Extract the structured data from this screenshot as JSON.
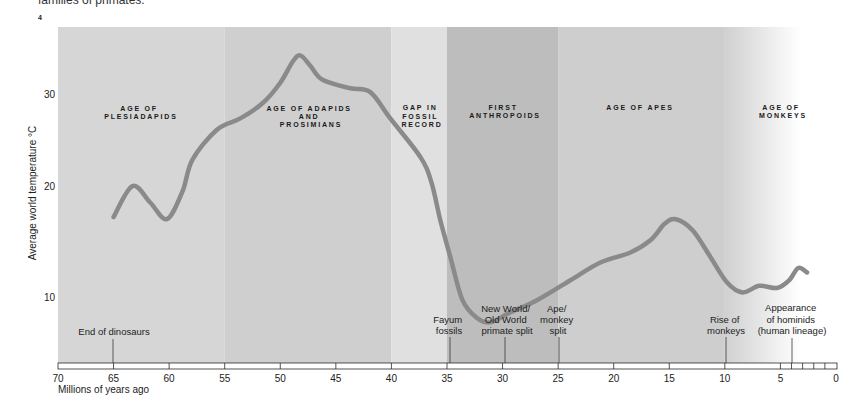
{
  "page": {
    "caption_fragment": "families of primates.",
    "figure_number": "4"
  },
  "chart_data": {
    "type": "line",
    "title": "",
    "xlabel": "Millions of years ago",
    "ylabel": "Average world temperature °C",
    "x_reversed": true,
    "xlim": [
      70,
      0
    ],
    "x_ticks": [
      70,
      65,
      60,
      55,
      50,
      45,
      40,
      35,
      30,
      25,
      20,
      15,
      10,
      5,
      0
    ],
    "x_ticks_labels": [
      "70",
      "65",
      "60",
      "55",
      "50",
      "45",
      "40",
      "35",
      "30",
      "25",
      "20",
      "15",
      "10",
      "5",
      "0"
    ],
    "x_minor_ticks": [
      4,
      3,
      2,
      1
    ],
    "y_ticks": [
      30,
      20,
      10
    ],
    "y_ticks_labels": [
      "30",
      "20",
      "10"
    ],
    "grid": false,
    "legend": null,
    "series": [
      {
        "name": "Average world temperature",
        "color": "#8a8a8a",
        "x": [
          65.0,
          63.3,
          61.7,
          60.2,
          58.8,
          57.9,
          55.7,
          53.6,
          51.6,
          50.0,
          48.9,
          48.2,
          47.3,
          46.2,
          43.7,
          41.9,
          40.1,
          37.4,
          36.4,
          35.6,
          34.7,
          33.6,
          32.3,
          31.1,
          29.3,
          26.9,
          23.9,
          21.2,
          18.5,
          16.7,
          15.4,
          14.4,
          12.9,
          11.3,
          9.8,
          8.4,
          6.9,
          5.3,
          4.2,
          3.4,
          2.6
        ],
        "y": [
          17.3,
          20.1,
          18.6,
          17.1,
          19.6,
          22.9,
          26.1,
          27.3,
          28.9,
          31.1,
          33.3,
          34.0,
          32.9,
          31.4,
          30.5,
          30.1,
          27.3,
          23.2,
          20.5,
          17.0,
          13.7,
          9.8,
          8.2,
          7.8,
          8.7,
          9.8,
          11.6,
          13.2,
          14.1,
          15.2,
          16.7,
          17.1,
          16.1,
          13.7,
          11.4,
          10.5,
          11.1,
          10.9,
          11.6,
          12.7,
          12.3
        ]
      }
    ],
    "periods": [
      {
        "from": 70,
        "to": 55,
        "color": "#d6d6d6",
        "label_lines": [
          "AGE OF",
          "PLESIADAPIDS"
        ]
      },
      {
        "from": 55,
        "to": 40,
        "color": "#cfcfcf",
        "label_lines": [
          "AGE OF ADAPIDS",
          "AND",
          "PROSIMIANS"
        ]
      },
      {
        "from": 40,
        "to": 35,
        "color": "#e0e0e0",
        "label_lines": [
          "GAP IN",
          "FOSSIL",
          "RECORD"
        ]
      },
      {
        "from": 35,
        "to": 25,
        "color": "#bdbdbd",
        "label_lines": [
          "FIRST",
          "ANTHROPOIDS"
        ]
      },
      {
        "from": 25,
        "to": 10,
        "color": "#cecece",
        "label_lines": [
          "AGE OF APES"
        ]
      },
      {
        "from": 10,
        "to": 0,
        "color": "#d0d0d0",
        "fade_to": "#ffffff",
        "label_lines": [
          "AGE OF",
          "MONKEYS"
        ]
      }
    ],
    "events": [
      {
        "at": 65,
        "label_lines": [
          "End of dinosaurs"
        ]
      },
      {
        "at": 35,
        "label_lines": [
          "Fayum",
          "fossils"
        ]
      },
      {
        "at": 30,
        "label_lines": [
          "New World/",
          "Old World",
          "primate split"
        ]
      },
      {
        "at": 25,
        "label_lines": [
          "Ape/",
          "monkey",
          "split"
        ]
      },
      {
        "at": 10,
        "label_lines": [
          "Rise of",
          "monkeys"
        ]
      },
      {
        "at": 4,
        "label_lines": [
          "Appearance",
          "of hominids",
          "(human lineage)"
        ]
      }
    ]
  }
}
